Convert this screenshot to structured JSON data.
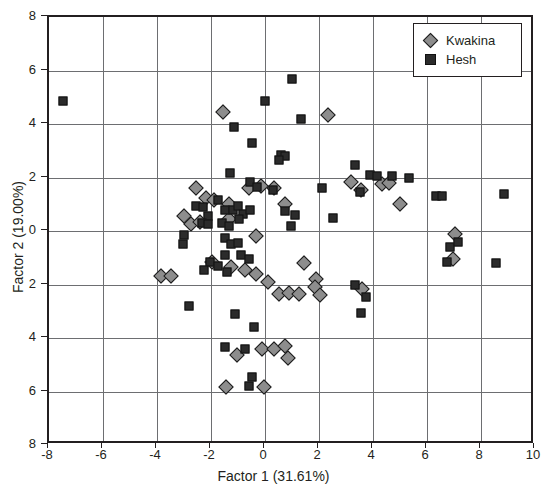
{
  "chart_data": {
    "type": "scatter",
    "title": "",
    "xlabel": "Factor 1 (31.61%)",
    "ylabel": "Factor 2 (19.00%)",
    "xlim": [
      -8,
      10
    ],
    "ylim": [
      -8,
      8
    ],
    "xticks": [
      -8,
      -6,
      -4,
      -2,
      0,
      2,
      4,
      6,
      8,
      10
    ],
    "yticks": [
      8,
      6,
      4,
      2,
      0,
      -2,
      -4,
      -6,
      -8
    ],
    "xticklabels": [
      "-8",
      "-6",
      "-4",
      "-2",
      "0",
      "2",
      "4",
      "6",
      "8",
      "10"
    ],
    "yticklabels": [
      "8",
      "6",
      "4",
      "2",
      "0",
      "2",
      "4",
      "6",
      "8"
    ],
    "grid": true,
    "grid_color": "#6d6e71",
    "frame_color": "#231f20",
    "legend_position": "top-right",
    "series": [
      {
        "name": "Kwakina",
        "marker": "diamond",
        "color": "#8d8d8d",
        "edge_color": "#1a1a1a",
        "points": [
          [
            -1.55,
            4.45
          ],
          [
            2.35,
            4.35
          ],
          [
            -2.55,
            1.6
          ],
          [
            -2.2,
            1.25
          ],
          [
            -1.9,
            1.15
          ],
          [
            -1.35,
            1.0
          ],
          [
            -0.6,
            1.6
          ],
          [
            -0.15,
            1.7
          ],
          [
            0.35,
            1.6
          ],
          [
            0.75,
            1.0
          ],
          [
            3.2,
            1.85
          ],
          [
            3.55,
            1.55
          ],
          [
            4.35,
            1.75
          ],
          [
            4.6,
            1.8
          ],
          [
            5.0,
            1.0
          ],
          [
            -3.0,
            0.55
          ],
          [
            -2.75,
            0.25
          ],
          [
            -2.4,
            0.35
          ],
          [
            -1.35,
            0.45
          ],
          [
            -0.35,
            -0.2
          ],
          [
            -3.85,
            -1.7
          ],
          [
            -3.5,
            -1.7
          ],
          [
            -1.95,
            -1.15
          ],
          [
            -1.25,
            -1.35
          ],
          [
            -0.75,
            -1.45
          ],
          [
            -0.35,
            -1.6
          ],
          [
            0.1,
            -1.9
          ],
          [
            1.45,
            -1.2
          ],
          [
            1.9,
            -1.8
          ],
          [
            3.6,
            -2.15
          ],
          [
            6.95,
            -1.05
          ],
          [
            7.05,
            -0.1
          ],
          [
            0.5,
            -2.35
          ],
          [
            0.9,
            -2.3
          ],
          [
            1.25,
            -2.35
          ],
          [
            1.85,
            -2.1
          ],
          [
            2.05,
            -2.4
          ],
          [
            -0.1,
            -4.4
          ],
          [
            0.35,
            -4.4
          ],
          [
            0.75,
            -4.3
          ],
          [
            -1.05,
            -4.65
          ],
          [
            0.85,
            -4.75
          ],
          [
            -1.45,
            -5.85
          ],
          [
            -0.05,
            -5.85
          ]
        ]
      },
      {
        "name": "Hesh",
        "marker": "square",
        "color": "#2b2b2b",
        "edge_color": "#111111",
        "points": [
          [
            -7.5,
            4.85
          ],
          [
            1.0,
            5.7
          ],
          [
            0.0,
            4.85
          ],
          [
            -1.15,
            3.9
          ],
          [
            1.35,
            4.2
          ],
          [
            -0.5,
            3.3
          ],
          [
            0.6,
            2.85
          ],
          [
            0.75,
            2.8
          ],
          [
            0.5,
            2.65
          ],
          [
            3.35,
            2.45
          ],
          [
            3.9,
            2.1
          ],
          [
            4.15,
            2.05
          ],
          [
            4.7,
            2.05
          ],
          [
            -1.3,
            2.15
          ],
          [
            -0.55,
            1.85
          ],
          [
            -0.3,
            1.65
          ],
          [
            0.3,
            1.55
          ],
          [
            5.35,
            2.0
          ],
          [
            2.1,
            1.6
          ],
          [
            3.5,
            1.45
          ],
          [
            6.35,
            1.3
          ],
          [
            6.55,
            1.3
          ],
          [
            8.85,
            1.4
          ],
          [
            2.5,
            0.5
          ],
          [
            -2.55,
            0.95
          ],
          [
            -2.3,
            0.9
          ],
          [
            -2.1,
            0.55
          ],
          [
            -1.75,
            1.15
          ],
          [
            -1.5,
            0.8
          ],
          [
            -1.2,
            0.8
          ],
          [
            -1.0,
            0.95
          ],
          [
            -0.8,
            0.65
          ],
          [
            -2.35,
            0.3
          ],
          [
            -2.1,
            0.25
          ],
          [
            -1.6,
            0.3
          ],
          [
            -1.35,
            0.2
          ],
          [
            -0.95,
            0.45
          ],
          [
            -0.55,
            0.8
          ],
          [
            0.75,
            0.75
          ],
          [
            1.1,
            0.6
          ],
          [
            0.95,
            0.2
          ],
          [
            -3.0,
            -0.15
          ],
          [
            -3.05,
            -0.5
          ],
          [
            -1.5,
            -0.25
          ],
          [
            -1.25,
            -0.5
          ],
          [
            -1.0,
            -0.45
          ],
          [
            -1.5,
            -0.9
          ],
          [
            -0.9,
            -0.9
          ],
          [
            -0.6,
            -1.05
          ],
          [
            -2.05,
            -1.15
          ],
          [
            -1.75,
            -1.3
          ],
          [
            -1.4,
            -1.55
          ],
          [
            -2.25,
            -1.45
          ],
          [
            6.85,
            -0.6
          ],
          [
            7.15,
            -0.4
          ],
          [
            6.75,
            -1.15
          ],
          [
            8.55,
            -1.2
          ],
          [
            -2.8,
            -2.8
          ],
          [
            -1.1,
            -3.1
          ],
          [
            -0.4,
            -3.6
          ],
          [
            -1.5,
            -4.35
          ],
          [
            3.35,
            -2.0
          ],
          [
            3.75,
            -2.45
          ],
          [
            3.55,
            -3.05
          ],
          [
            -0.75,
            -4.4
          ],
          [
            -0.6,
            -5.8
          ],
          [
            -0.5,
            -5.45
          ]
        ]
      }
    ]
  }
}
